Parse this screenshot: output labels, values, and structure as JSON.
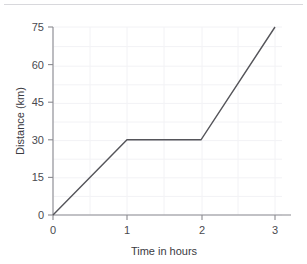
{
  "chart_data": {
    "type": "line",
    "title": "",
    "xlabel": "Time in hours",
    "ylabel": "Distance (km)",
    "xlim": [
      0,
      3.2
    ],
    "ylim": [
      0,
      75
    ],
    "xticks": [
      0,
      1,
      2,
      3
    ],
    "xtick_labels": [
      "0",
      "1",
      "2",
      "3"
    ],
    "yticks": [
      0,
      15,
      30,
      45,
      60,
      75
    ],
    "ytick_labels": [
      "0",
      "15",
      "30",
      "45",
      "60",
      "75"
    ],
    "grid": true,
    "grid_color": "#f2f2f5",
    "legend": false,
    "series": [
      {
        "name": "distance",
        "color": "#55555a",
        "x": [
          0,
          1,
          2,
          3
        ],
        "values": [
          0,
          30,
          30,
          75
        ]
      }
    ],
    "annotations": []
  },
  "axes": {
    "x_label": "Time in hours",
    "y_label": "Distance (km)",
    "x_tick_0": "0",
    "x_tick_1": "1",
    "x_tick_2": "2",
    "x_tick_3": "3",
    "y_tick_0": "0",
    "y_tick_1": "15",
    "y_tick_2": "30",
    "y_tick_3": "45",
    "y_tick_4": "60",
    "y_tick_5": "75"
  },
  "colors": {
    "line": "#55555a",
    "axis": "#8a8a90",
    "grid": "#f2f2f5",
    "text": "#3a3a3f",
    "rule": "#d8d8dc"
  }
}
